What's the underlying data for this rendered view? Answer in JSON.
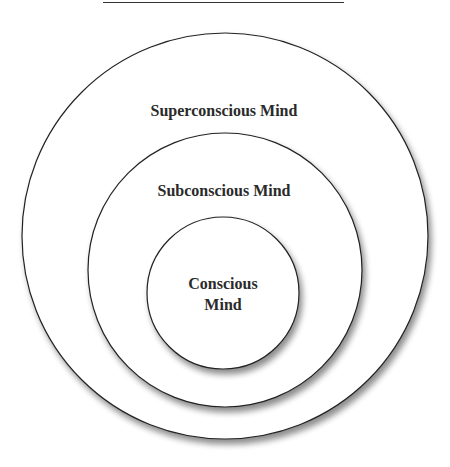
{
  "diagram": {
    "type": "nested-circles",
    "layers": [
      {
        "label": "Superconscious Mind",
        "role": "outer"
      },
      {
        "label": "Subconscious Mind",
        "role": "middle"
      },
      {
        "label_line1": "Conscious",
        "label_line2": "Mind",
        "role": "inner"
      }
    ]
  }
}
